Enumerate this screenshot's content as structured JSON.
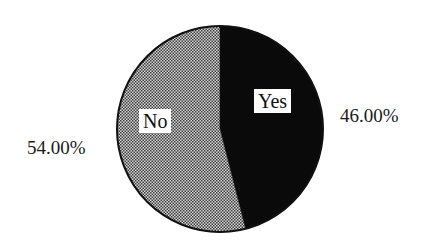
{
  "chart_data": {
    "type": "pie",
    "title": "",
    "categories": [
      "Yes",
      "No"
    ],
    "values": [
      46.0,
      54.0
    ],
    "value_labels": [
      "46.00%",
      "54.00%"
    ],
    "colors": [
      "#0a0a0a",
      "#9a9a9a"
    ],
    "fill_patterns": [
      "solid-black",
      "dotted-halftone-gray"
    ],
    "start_angle_deg": 0,
    "direction": "clockwise",
    "legend": "none",
    "labels_inside": true
  },
  "labels": {
    "yes_slice": "Yes",
    "no_slice": "No",
    "yes_percent": "46.00%",
    "no_percent": "54.00%"
  }
}
